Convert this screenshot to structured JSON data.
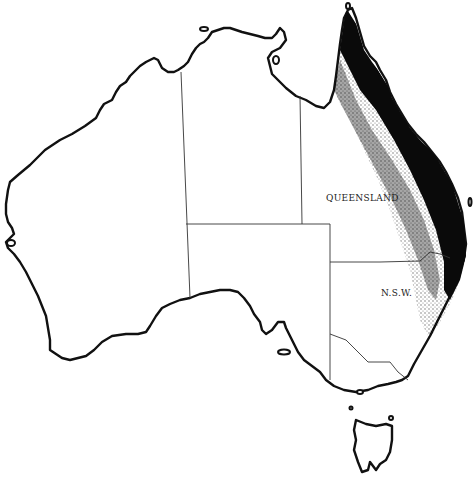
{
  "map": {
    "subject": "Australia",
    "labels": {
      "queensland": "QUEENSLAND",
      "nsw": "N.S.W."
    },
    "distribution": {
      "description": "Dense stippled range along eastern Queensland and northern N.S.W. coast",
      "color": "#000000"
    },
    "colors": {
      "land": "#ffffff",
      "coastline": "#111111",
      "state_borders": "#333333"
    }
  }
}
